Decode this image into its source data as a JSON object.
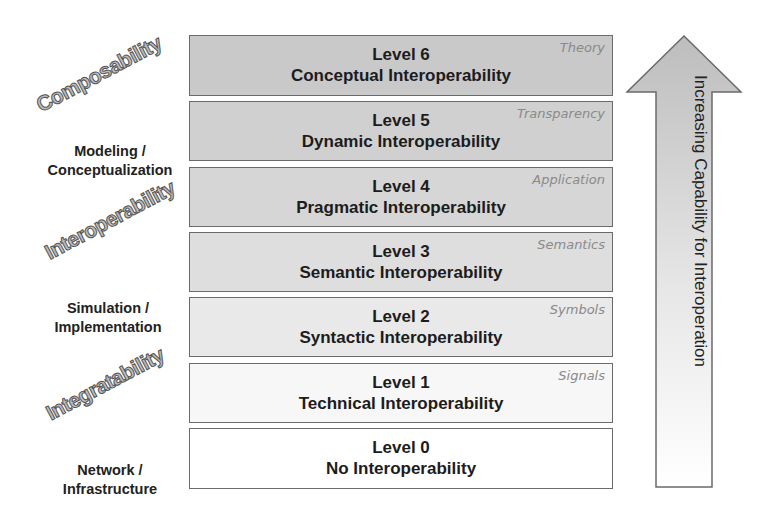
{
  "levels": [
    {
      "level": "Level 6",
      "name": "Conceptual Interoperability",
      "tag": "Theory",
      "fill": "#c9c9c9"
    },
    {
      "level": "Level 5",
      "name": "Dynamic Interoperability",
      "tag": "Transparency",
      "fill": "#d0d0d0"
    },
    {
      "level": "Level 4",
      "name": "Pragmatic Interoperability",
      "tag": "Application",
      "fill": "#d6d6d6"
    },
    {
      "level": "Level 3",
      "name": "Semantic Interoperability",
      "tag": "Semantics",
      "fill": "#dedede"
    },
    {
      "level": "Level 2",
      "name": "Syntactic Interoperability",
      "tag": "Symbols",
      "fill": "#e9e9e9"
    },
    {
      "level": "Level 1",
      "name": "Technical Interoperability",
      "tag": "Signals",
      "fill": "#f7f7f7"
    },
    {
      "level": "Level 0",
      "name": "No Interoperability",
      "tag": "",
      "fill": "#ffffff"
    }
  ],
  "side_labels": {
    "modeling": [
      "Modeling /",
      "Conceptualization"
    ],
    "simulation": [
      "Simulation /",
      "Implementation"
    ],
    "network": [
      "Network /",
      "Infrastructure"
    ]
  },
  "diagonal_labels": {
    "composability": "Composability",
    "interoperability": "Interoperability",
    "integratability": "Integratability"
  },
  "arrow": {
    "label": "Increasing Capability for Interoperation"
  }
}
